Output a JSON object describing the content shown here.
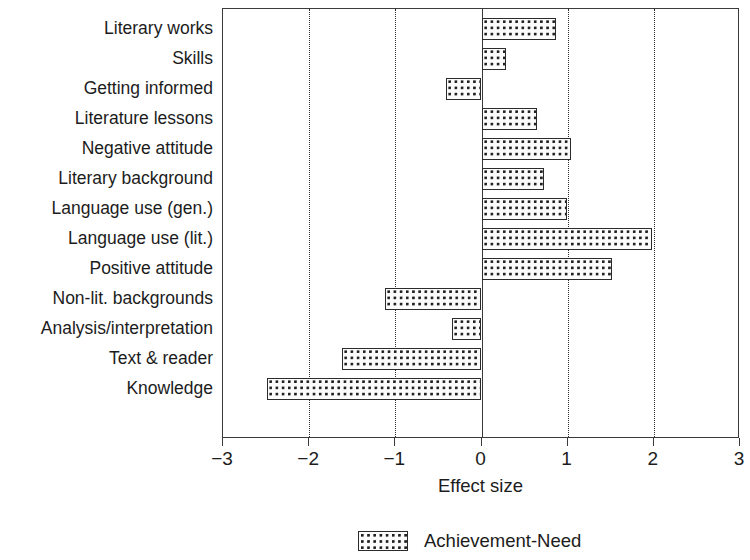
{
  "chart_data": {
    "type": "bar",
    "orientation": "horizontal",
    "title": "",
    "xlabel": "Effect size",
    "ylabel": "",
    "xlim": [
      -3,
      3
    ],
    "xticks": [
      -3,
      -2,
      -1,
      0,
      1,
      2,
      3
    ],
    "xticklabels": [
      "−3",
      "−2",
      "−1",
      "0",
      "1",
      "2",
      "3"
    ],
    "grid": "vertical dotted gridlines at -2, -1, 1, 2; solid axis line at 0",
    "legend": {
      "position": "below-axis-centered",
      "entries": [
        {
          "name": "Achievement-Need",
          "pattern": "dotted-fill"
        }
      ]
    },
    "categories": [
      "Literary works",
      "Skills",
      "Getting informed",
      "Literature lessons",
      "Negative attitude",
      "Literary background",
      "Language use (gen.)",
      "Language use (lit.)",
      "Positive attitude",
      "Non-lit. backgrounds",
      "Analysis/interpretation",
      "Text & reader",
      "Knowledge"
    ],
    "series": [
      {
        "name": "Achievement-Need",
        "values": [
          0.87,
          0.28,
          -0.41,
          0.64,
          1.04,
          0.72,
          0.99,
          1.98,
          1.52,
          -1.12,
          -0.34,
          -1.62,
          -2.49
        ]
      }
    ]
  },
  "colors": {
    "frame": "#3a3a3a",
    "bar_border": "#2b2b2b",
    "bar_fill": "#fbfbfb",
    "bar_dots": "#1f1f1f",
    "text": "#1c1c1c",
    "background": "#ffffff"
  }
}
